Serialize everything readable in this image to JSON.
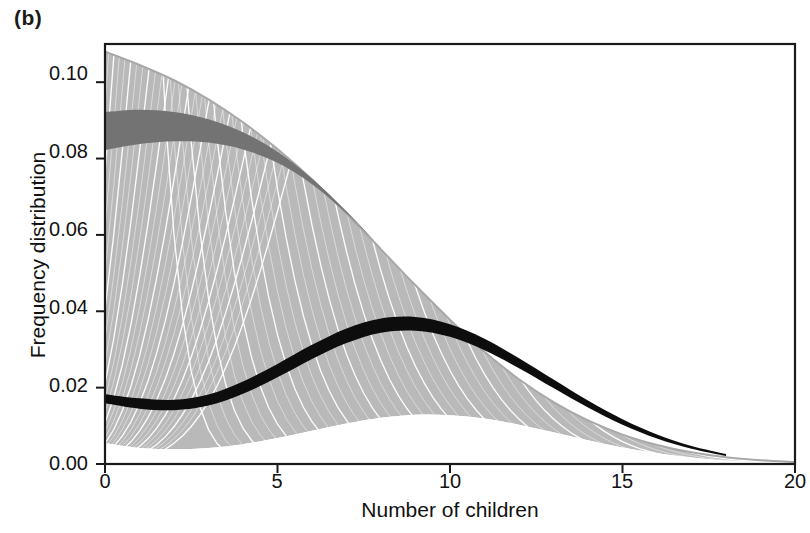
{
  "panel": {
    "label": "(b)"
  },
  "axes": {
    "xlabel": "Number of children",
    "ylabel": "Frequency distribution",
    "xticks": [
      "0",
      "5",
      "10",
      "15",
      "20"
    ],
    "yticks": [
      "0.00",
      "0.02",
      "0.04",
      "0.06",
      "0.08",
      "0.10"
    ]
  },
  "colors": {
    "light_band": "#b9b9b9",
    "dark_band": "#737373",
    "black_band": "#0d0d0d",
    "curve_separator": "#ffffff",
    "frame": "#1a1a1a",
    "gridline": "#ebebeb",
    "background": "#ffffff"
  },
  "chart_data": {
    "type": "line",
    "title": "",
    "subtitle": "",
    "xlabel": "Number of children",
    "ylabel": "Frequency distribution",
    "xlim": [
      0,
      20
    ],
    "ylim": [
      0.0,
      0.11
    ],
    "xticks": [
      0,
      5,
      10,
      15,
      20
    ],
    "yticks": [
      0.0,
      0.02,
      0.04,
      0.06,
      0.08,
      0.1
    ],
    "grid": true,
    "legend": "none",
    "annotations": [
      "Fan of overlapping frequency distributions (spaghetti plot) of number of children",
      "Dark grey highlighted band near upper envelope at low x",
      "Black highlighted band tracking a central trajectory peaking near x = 9"
    ],
    "series": [
      {
        "name": "envelope-upper",
        "role": "upper boundary of fan",
        "x": [
          0,
          1,
          2,
          3,
          4,
          5,
          6,
          7,
          8,
          9,
          10,
          11,
          12,
          13,
          14,
          15,
          16,
          17,
          18,
          19,
          20
        ],
        "values": [
          0.108,
          0.1045,
          0.1005,
          0.0955,
          0.0895,
          0.0825,
          0.0745,
          0.0655,
          0.0562,
          0.0468,
          0.0378,
          0.0294,
          0.0222,
          0.0162,
          0.0114,
          0.0077,
          0.005,
          0.0031,
          0.0018,
          0.001,
          0.0005
        ]
      },
      {
        "name": "envelope-lower",
        "role": "lower boundary of fan",
        "x": [
          0,
          1,
          2,
          3,
          4,
          5,
          6,
          7,
          8,
          9,
          10,
          11,
          12,
          13,
          14,
          15,
          16,
          17,
          18,
          19,
          20
        ],
        "values": [
          0.0055,
          0.0042,
          0.0039,
          0.0042,
          0.0052,
          0.0068,
          0.0087,
          0.0106,
          0.0121,
          0.0129,
          0.0128,
          0.0119,
          0.0103,
          0.0083,
          0.0062,
          0.0043,
          0.0028,
          0.0017,
          0.0009,
          0.0004,
          0.0002
        ]
      },
      {
        "name": "dark-grey-band-upper",
        "role": "highlighted band upper edge",
        "x": [
          0,
          1,
          2,
          3,
          4,
          5,
          6,
          7,
          8
        ],
        "values": [
          0.0922,
          0.0928,
          0.0922,
          0.0903,
          0.0869,
          0.0818,
          0.0748,
          0.0662,
          0.0566
        ]
      },
      {
        "name": "dark-grey-band-lower",
        "role": "highlighted band lower edge",
        "x": [
          0,
          1,
          2,
          3,
          4,
          5,
          6,
          7,
          8
        ],
        "values": [
          0.0822,
          0.0838,
          0.0845,
          0.0842,
          0.0824,
          0.0789,
          0.0733,
          0.0657,
          0.0566
        ]
      },
      {
        "name": "black-band-upper",
        "role": "central highlighted trajectory upper edge",
        "x": [
          0,
          1,
          2,
          3,
          4,
          5,
          6,
          7,
          8,
          9,
          10,
          11,
          12,
          13,
          14,
          15,
          16,
          17,
          18
        ],
        "values": [
          0.0183,
          0.0172,
          0.0168,
          0.0182,
          0.0216,
          0.0262,
          0.0312,
          0.0355,
          0.0381,
          0.0385,
          0.0366,
          0.0328,
          0.0277,
          0.0221,
          0.0166,
          0.0117,
          0.0077,
          0.0047,
          0.0026
        ]
      },
      {
        "name": "black-band-lower",
        "role": "central highlighted trajectory lower edge",
        "x": [
          0,
          1,
          2,
          3,
          4,
          5,
          6,
          7,
          8,
          9,
          10,
          11,
          12,
          13,
          14,
          15,
          16,
          17,
          18
        ],
        "values": [
          0.0159,
          0.0145,
          0.0141,
          0.0153,
          0.0184,
          0.0227,
          0.0275,
          0.0317,
          0.0344,
          0.0349,
          0.0333,
          0.0298,
          0.0251,
          0.0199,
          0.0148,
          0.0103,
          0.0067,
          0.004,
          0.0021
        ]
      }
    ],
    "fan_description": {
      "n_curves": 40,
      "family": "Poisson-like frequency distributions with mean varying across the fan",
      "mean_range": [
        0.45,
        9.0
      ],
      "peak_of_upper_envelope_at_x": 0,
      "peak_of_black_band_at_x": 9,
      "fan_converges_to_zero_near_x": 19
    }
  }
}
